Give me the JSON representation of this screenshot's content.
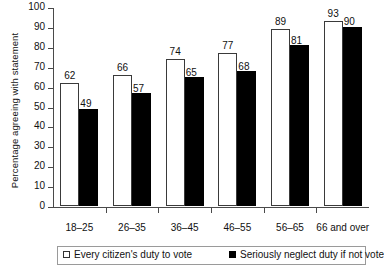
{
  "chart_data": {
    "type": "bar",
    "title": "",
    "xlabel": "",
    "ylabel": "Percentage agreeing with statement",
    "ylim": [
      0,
      100
    ],
    "ytick_step": 10,
    "yticks": [
      0,
      10,
      20,
      30,
      40,
      50,
      60,
      70,
      80,
      90,
      100
    ],
    "grid": false,
    "legend_position": "bottom",
    "categories": [
      "18–25",
      "26–35",
      "36–45",
      "46–55",
      "56–65",
      "66 and over"
    ],
    "series": [
      {
        "name": "Every citizen's duty to vote",
        "color": "#ffffff",
        "edge_color": "#3a3a3a",
        "values": [
          62,
          66,
          74,
          77,
          89,
          93
        ]
      },
      {
        "name": "Seriously neglect duty if not vote",
        "color": "#000000",
        "edge_color": "#000000",
        "values": [
          49,
          57,
          65,
          68,
          81,
          90
        ]
      }
    ]
  },
  "legend": {
    "entries": [
      {
        "label": "Every citizen's duty to vote",
        "swatch": "light"
      },
      {
        "label": "Seriously neglect duty if not vote",
        "swatch": "dark"
      }
    ]
  }
}
